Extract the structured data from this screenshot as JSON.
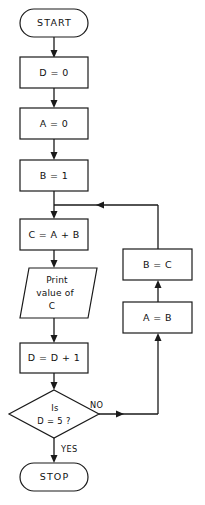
{
  "diagram": {
    "background_color": "#ffffff",
    "line_color": "#1a1a1a",
    "shape_fill": "#ffffff",
    "nodes": {
      "start": {
        "label": "START",
        "shape": "terminator"
      },
      "init_d": {
        "label": "D = 0",
        "shape": "process"
      },
      "init_a": {
        "label": "A = 0",
        "shape": "process"
      },
      "init_b": {
        "label": "B = 1",
        "shape": "process"
      },
      "compute_c": {
        "label": "C = A + B",
        "shape": "process"
      },
      "print_c": {
        "shape": "input-output",
        "line1": "Print",
        "line2": "value of",
        "line3": "C"
      },
      "increment_d": {
        "label": "D = D + 1",
        "shape": "process"
      },
      "decision": {
        "shape": "decision",
        "line1": "Is",
        "line2": "D = 5 ?"
      },
      "assign_b_c": {
        "label": "B = C",
        "shape": "process"
      },
      "assign_a_b": {
        "label": "A = B",
        "shape": "process"
      },
      "stop": {
        "label": "STOP",
        "shape": "terminator"
      }
    },
    "edge_labels": {
      "no": "NO",
      "yes": "YES"
    }
  }
}
